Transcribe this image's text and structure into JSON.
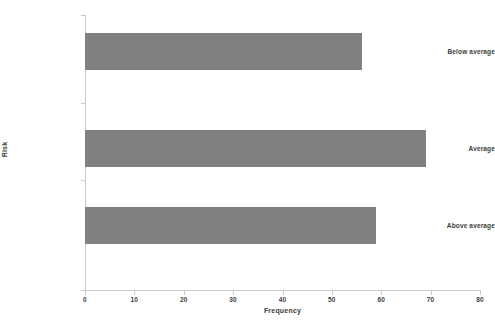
{
  "chart_data": {
    "type": "bar",
    "orientation": "horizontal",
    "title": "",
    "xlabel": "Frequency",
    "ylabel": "Risk",
    "categories": [
      "Below average",
      "Average",
      "Above average"
    ],
    "values": [
      56,
      69,
      59
    ],
    "xlim": [
      0,
      80
    ],
    "xticks": [
      "0",
      "10",
      "20",
      "30",
      "40",
      "50",
      "60",
      "70",
      "80"
    ],
    "xtick_values": [
      0,
      10,
      20,
      30,
      40,
      50,
      60,
      70,
      80
    ],
    "grid": false,
    "legend": false,
    "bar_color": "#808080",
    "axis_color": "#c9c9c9",
    "text_color": "#3d3d3d",
    "background": "#ffffff",
    "series": [
      {
        "name": "Frequency",
        "values": [
          56,
          69,
          59
        ]
      }
    ]
  }
}
